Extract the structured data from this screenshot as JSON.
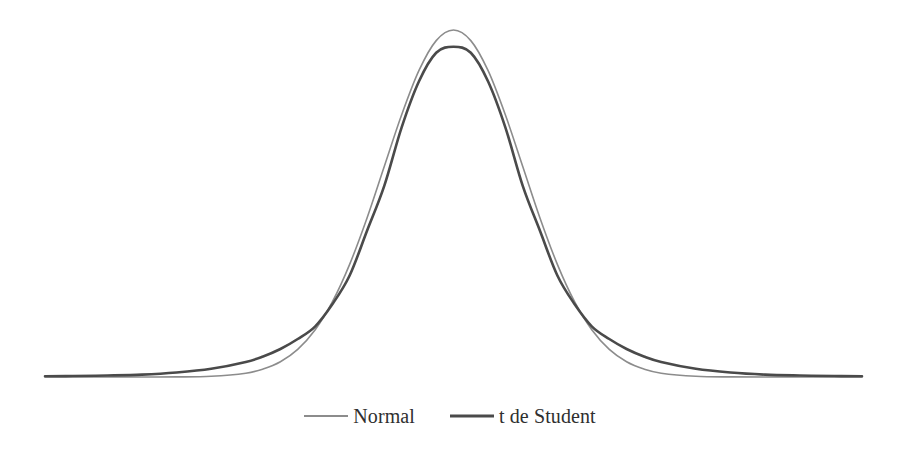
{
  "chart_data": {
    "type": "line",
    "title": "",
    "subtitle": "",
    "xlabel": "",
    "ylabel": "",
    "grid": false,
    "axes_visible": false,
    "legend_position": "bottom-center",
    "xlim": [
      -5.9,
      5.9
    ],
    "ylim": [
      0,
      0.42
    ],
    "series": [
      {
        "name": "Normal",
        "distribution": "normal",
        "mean": 0,
        "sd": 1,
        "peak_value": 0.399,
        "color": "#8c8c8c",
        "line_width": 1.6,
        "x": [
          -5.9,
          -5.5,
          -5.0,
          -4.5,
          -4.0,
          -3.5,
          -3.0,
          -2.75,
          -2.5,
          -2.25,
          -2.0,
          -1.75,
          -1.5,
          -1.25,
          -1.0,
          -0.75,
          -0.5,
          -0.25,
          0.0,
          0.25,
          0.5,
          0.75,
          1.0,
          1.25,
          1.5,
          1.75,
          2.0,
          2.25,
          2.5,
          2.75,
          3.0,
          3.5,
          4.0,
          4.5,
          5.0,
          5.5,
          5.9
        ],
        "values": [
          0.0,
          0.0,
          0.0,
          0.0,
          0.0001,
          0.0009,
          0.0044,
          0.0091,
          0.0175,
          0.0317,
          0.054,
          0.0863,
          0.1295,
          0.1826,
          0.242,
          0.3011,
          0.3521,
          0.3867,
          0.3989,
          0.3867,
          0.3521,
          0.3011,
          0.242,
          0.1826,
          0.1295,
          0.0863,
          0.054,
          0.0317,
          0.0175,
          0.0091,
          0.0044,
          0.0009,
          0.0001,
          0.0,
          0.0,
          0.0,
          0.0
        ]
      },
      {
        "name": "t de Student",
        "distribution": "student-t",
        "df": 5,
        "peak_value": 0.38,
        "color": "#4a4a4a",
        "line_width": 2.6,
        "x": [
          -5.9,
          -5.5,
          -5.0,
          -4.5,
          -4.0,
          -3.5,
          -3.0,
          -2.75,
          -2.5,
          -2.25,
          -2.0,
          -1.75,
          -1.5,
          -1.25,
          -1.0,
          -0.75,
          -0.5,
          -0.25,
          0.0,
          0.25,
          0.5,
          0.75,
          1.0,
          1.25,
          1.5,
          1.75,
          2.0,
          2.25,
          2.5,
          2.75,
          3.0,
          3.5,
          4.0,
          4.5,
          5.0,
          5.5,
          5.9
        ],
        "values": [
          0.0008,
          0.0011,
          0.0017,
          0.0027,
          0.0051,
          0.0094,
          0.0173,
          0.0236,
          0.0322,
          0.0437,
          0.058,
          0.0836,
          0.1167,
          0.1678,
          0.2197,
          0.2867,
          0.3397,
          0.3727,
          0.3796,
          0.3727,
          0.3397,
          0.2867,
          0.2197,
          0.1678,
          0.1167,
          0.0836,
          0.058,
          0.0437,
          0.0322,
          0.0236,
          0.0173,
          0.0094,
          0.0051,
          0.0027,
          0.0017,
          0.0011,
          0.0008
        ]
      }
    ],
    "legend": [
      {
        "label": "Normal",
        "color": "#8c8c8c",
        "line_width": 1.6
      },
      {
        "label": "t de Student",
        "color": "#4a4a4a",
        "line_width": 2.6
      }
    ]
  },
  "legend": {
    "items": [
      {
        "label": "Normal"
      },
      {
        "label": "t de Student"
      }
    ]
  },
  "colors": {
    "background": "#ffffff",
    "normal_line": "#8c8c8c",
    "t_line": "#4a4a4a",
    "legend_text": "#2f2f2f"
  }
}
